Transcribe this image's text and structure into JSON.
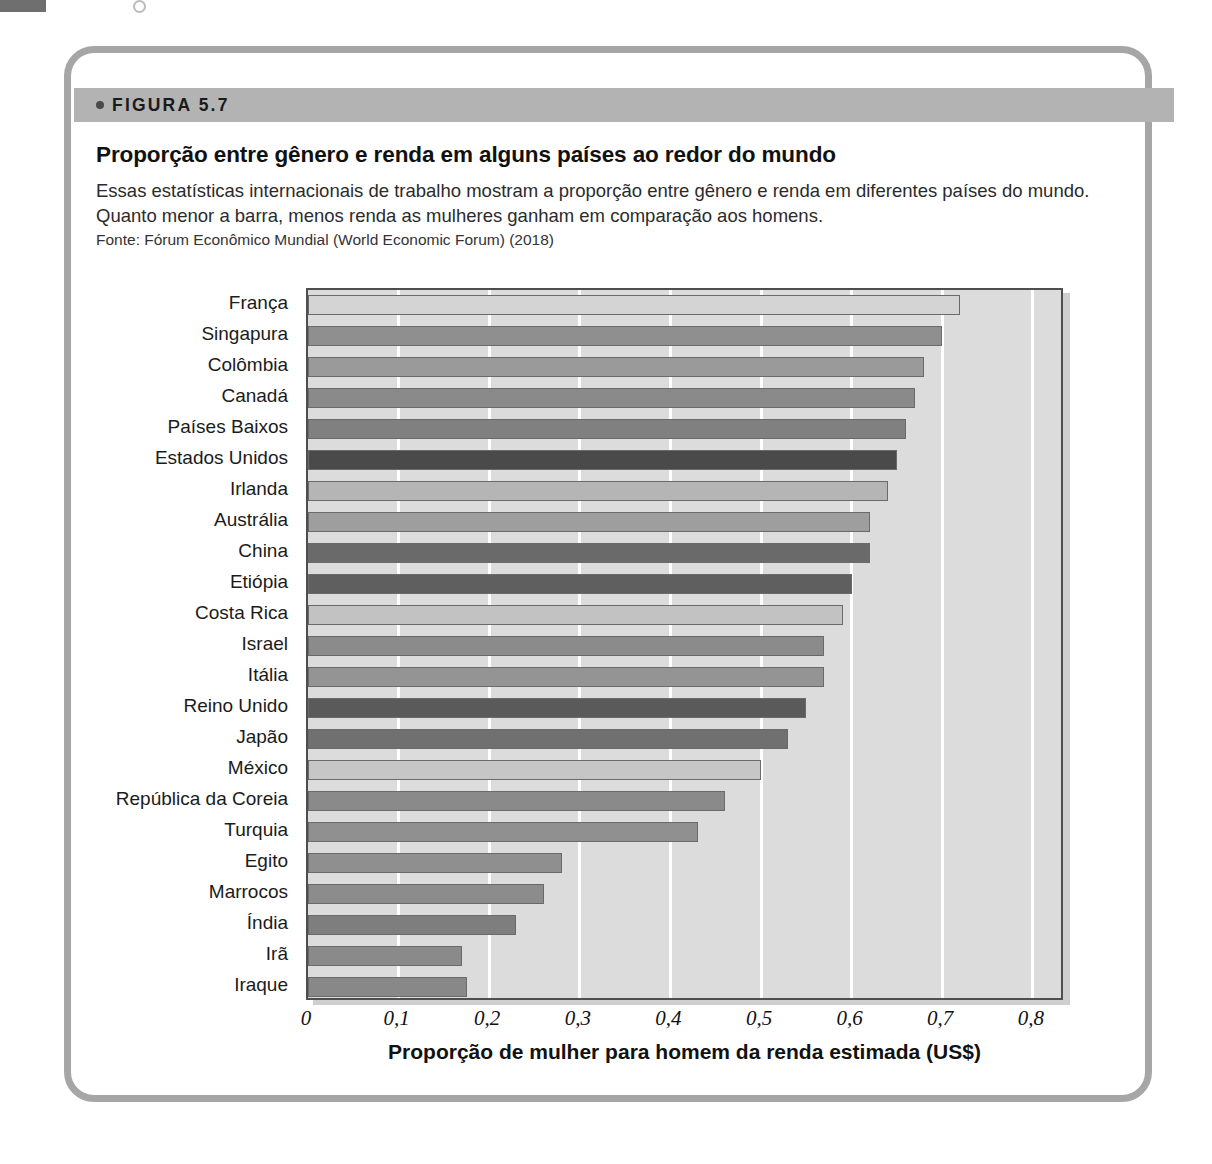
{
  "figure": {
    "label": "FIGURA 5.7",
    "bullet_icon": "bullet-dot-icon",
    "title": "Proporção entre gênero e renda em alguns países ao redor do mundo",
    "description": "Essas estatísticas internacionais de trabalho mostram a proporção entre gênero e renda em diferentes países do mundo. Quanto menor a barra, menos renda as mulheres ganham em comparação aos homens.",
    "source": "Fonte: Fórum Econômico Mundial (World Economic Forum) (2018)"
  },
  "colors": {
    "band": "#b3b3b3",
    "frame": "#a6a6a6",
    "plot_bg": "#dcdcdc",
    "gridline": "#ffffff",
    "bar_light": "#d4d4d4",
    "bar_mid": "#9a9a9a",
    "bar_dark": "#737373",
    "bar_darkest": "#585858",
    "axis": "#4e4e4e"
  },
  "chart_data": {
    "type": "bar",
    "orientation": "horizontal",
    "title": "Proporção entre gênero e renda em alguns países ao redor do mundo",
    "xlabel": "Proporção de mulher para homem da renda estimada (US$)",
    "ylabel": "",
    "xlim": [
      0,
      0.85
    ],
    "grid": true,
    "legend": "none",
    "xticks": [
      0,
      0.1,
      0.2,
      0.3,
      0.4,
      0.5,
      0.6,
      0.7,
      0.8
    ],
    "xtick_labels": [
      "0",
      "0,1",
      "0,2",
      "0,3",
      "0,4",
      "0,5",
      "0,6",
      "0,7",
      "0,8"
    ],
    "categories": [
      "França",
      "Singapura",
      "Colômbia",
      "Canadá",
      "Países Baixos",
      "Estados Unidos",
      "Irlanda",
      "Austrália",
      "China",
      "Etiópia",
      "Costa Rica",
      "Israel",
      "Itália",
      "Reino Unido",
      "Japão",
      "México",
      "República da Coreia",
      "Turquia",
      "Egito",
      "Marrocos",
      "Índia",
      "Irã",
      "Iraque"
    ],
    "values": [
      0.72,
      0.7,
      0.68,
      0.67,
      0.66,
      0.65,
      0.64,
      0.62,
      0.62,
      0.6,
      0.59,
      0.57,
      0.57,
      0.55,
      0.53,
      0.5,
      0.46,
      0.43,
      0.28,
      0.26,
      0.23,
      0.17,
      0.175
    ],
    "bar_colors": [
      "#d4d4d4",
      "#8f8f8f",
      "#9a9a9a",
      "#8a8a8a",
      "#808080",
      "#4a4a4a",
      "#b5b5b5",
      "#9e9e9e",
      "#6a6a6a",
      "#5f5f5f",
      "#c2c2c2",
      "#8b8b8b",
      "#949494",
      "#5a5a5a",
      "#707070",
      "#c6c6c6",
      "#8a8a8a",
      "#909090",
      "#8f8f8f",
      "#8c8c8c",
      "#7e7e7e",
      "#8a8a8a",
      "#888888"
    ]
  }
}
